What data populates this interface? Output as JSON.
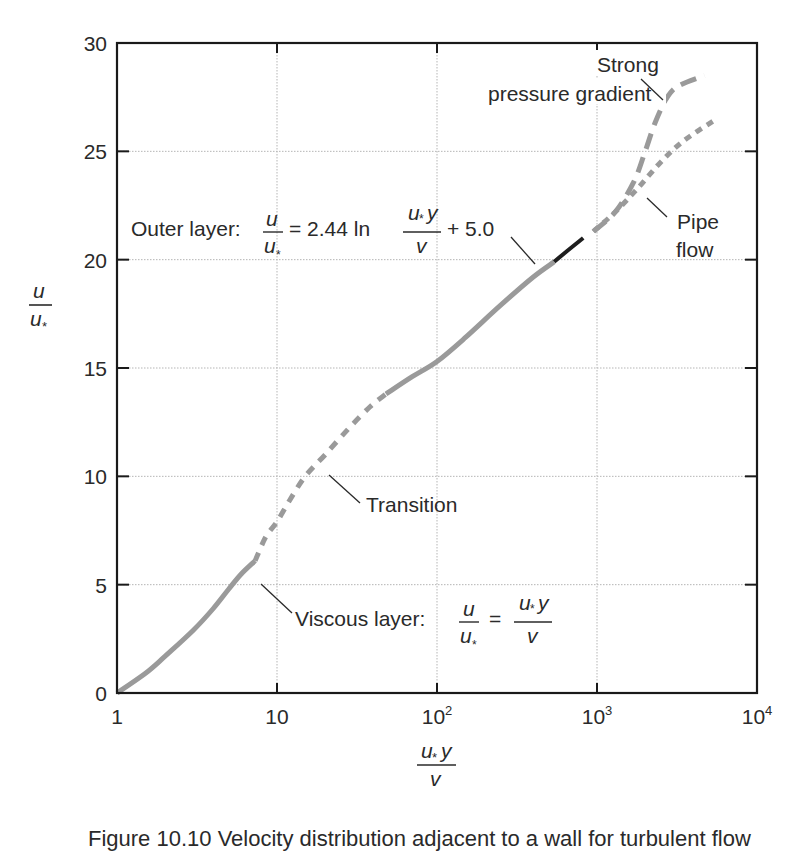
{
  "chart_data": {
    "type": "line",
    "title": "",
    "xlabel": "u*y / ν",
    "ylabel": "u / u*",
    "xscale": "log",
    "xlim": [
      1,
      10000
    ],
    "ylim": [
      0,
      30
    ],
    "grid": true,
    "x_ticks": [
      {
        "value": 1,
        "label": "1",
        "exp": ""
      },
      {
        "value": 10,
        "label": "10",
        "exp": ""
      },
      {
        "value": 100,
        "label": "10",
        "exp": "2"
      },
      {
        "value": 1000,
        "label": "10",
        "exp": "3"
      },
      {
        "value": 10000,
        "label": "10",
        "exp": "4"
      }
    ],
    "y_ticks": [
      0,
      5,
      10,
      15,
      20,
      25,
      30
    ],
    "series": [
      {
        "name": "Viscous layer",
        "style": "solid",
        "color": "#9a9a9a",
        "x": [
          1,
          1.5,
          2,
          3,
          4,
          5,
          6,
          7.3
        ],
        "y": [
          0,
          0.9,
          1.7,
          2.9,
          3.9,
          4.8,
          5.5,
          6.1
        ]
      },
      {
        "name": "Transition",
        "style": "dashed",
        "color": "#9a9a9a",
        "x": [
          7.3,
          8.5,
          10,
          12,
          15,
          20,
          28,
          38,
          48
        ],
        "y": [
          6.1,
          7.2,
          7.9,
          8.9,
          10.0,
          11.0,
          12.2,
          13.2,
          13.8
        ]
      },
      {
        "name": "Outer layer (log law)",
        "style": "solid",
        "color": "#9a9a9a",
        "x": [
          48,
          70,
          100,
          150,
          250,
          400,
          540
        ],
        "y": [
          13.8,
          14.6,
          15.3,
          16.4,
          17.9,
          19.2,
          19.9
        ]
      },
      {
        "name": "Outer layer (overlap)",
        "style": "solid",
        "color": "#1e1e1e",
        "x": [
          540,
          650,
          820
        ],
        "y": [
          19.9,
          20.4,
          21.0
        ]
      },
      {
        "name": "Strong pressure gradient",
        "style": "long-dashed",
        "color": "#9a9a9a",
        "x": [
          950,
          1300,
          1700,
          2000,
          2300,
          2700,
          3200,
          4700
        ],
        "y": [
          21.3,
          22.2,
          23.6,
          25.0,
          26.3,
          27.4,
          28.0,
          28.5
        ]
      },
      {
        "name": "Pipe flow",
        "style": "dotted",
        "color": "#9a9a9a",
        "x": [
          950,
          1300,
          1800,
          2500,
          3500,
          5600
        ],
        "y": [
          21.3,
          22.2,
          23.3,
          24.5,
          25.5,
          26.5
        ]
      }
    ],
    "annotations": [
      {
        "text": "Outer layer: u/u* = 2.44 ln(u*y/ν) + 5.0",
        "points_to": [
          540,
          19.9
        ]
      },
      {
        "text": "Transition",
        "points_to": [
          17,
          10.6
        ]
      },
      {
        "text": "Viscous layer: u/u* = u*y/ν",
        "points_to": [
          6.3,
          5.5
        ]
      },
      {
        "text": "Strong pressure gradient",
        "points_to": [
          2500,
          26.7
        ]
      },
      {
        "text": "Pipe flow",
        "points_to": [
          1700,
          22.9
        ]
      }
    ]
  },
  "labels": {
    "y_axis": {
      "num": "u",
      "den": "u",
      "den_sub": "*"
    },
    "x_axis": {
      "num_a": "u",
      "num_sub": "*",
      "num_b": "y",
      "den": "v"
    },
    "outer": {
      "prefix": "Outer layer:",
      "num": "u",
      "den": "u",
      "sub": "*",
      "eq": "= 2.44 ln",
      "frac_num_a": "u",
      "frac_num_b": "y",
      "frac_den": "v",
      "suffix": "+ 5.0"
    },
    "viscous": {
      "prefix": "Viscous layer:",
      "num": "u",
      "den": "u",
      "sub": "*",
      "eq": "=",
      "frac_num_a": "u",
      "frac_num_b": "y",
      "frac_den": "v"
    },
    "transition": "Transition",
    "strong_1": "Strong",
    "strong_2": "pressure gradient",
    "pipe_1": "Pipe",
    "pipe_2": "flow"
  },
  "caption": "Figure 10.10 Velocity distribution adjacent to a wall for turbulent flow"
}
